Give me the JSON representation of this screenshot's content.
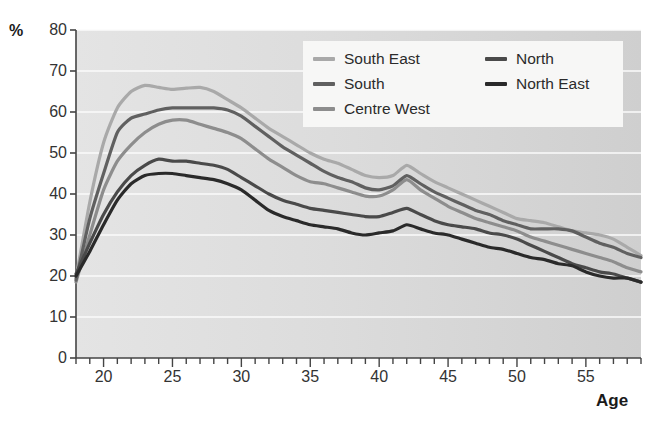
{
  "chart_data": {
    "type": "line",
    "title": "",
    "xlabel": "Age",
    "ylabel": "%",
    "xlim": [
      18,
      59
    ],
    "ylim": [
      0,
      80
    ],
    "grid": true,
    "legend_position": "top-right-inside",
    "y_ticks": [
      0,
      10,
      20,
      30,
      40,
      50,
      60,
      70,
      80
    ],
    "x_ticks": [
      20,
      25,
      30,
      35,
      40,
      45,
      50,
      55
    ],
    "x": [
      18,
      19,
      20,
      21,
      22,
      23,
      24,
      25,
      26,
      27,
      28,
      29,
      30,
      31,
      32,
      33,
      34,
      35,
      36,
      37,
      38,
      39,
      40,
      41,
      42,
      43,
      44,
      45,
      46,
      47,
      48,
      49,
      50,
      51,
      52,
      53,
      54,
      55,
      56,
      57,
      58,
      59
    ],
    "series": [
      {
        "name": "South East",
        "color": "#a9a9a9",
        "values": [
          19.5,
          38.0,
          52.5,
          61.0,
          65.0,
          66.5,
          66.0,
          65.5,
          65.8,
          66.0,
          65.0,
          63.0,
          61.0,
          58.5,
          56.0,
          54.0,
          52.0,
          50.0,
          48.5,
          47.5,
          46.0,
          44.5,
          44.0,
          44.5,
          47.0,
          45.0,
          43.0,
          41.5,
          40.0,
          38.5,
          37.0,
          35.5,
          34.0,
          33.5,
          33.0,
          32.0,
          31.0,
          30.5,
          30.0,
          29.0,
          27.0,
          25.0
        ]
      },
      {
        "name": "South",
        "color": "#606060",
        "values": [
          19.0,
          34.0,
          45.0,
          55.0,
          58.5,
          59.5,
          60.5,
          61.0,
          61.0,
          61.0,
          61.0,
          60.5,
          59.0,
          56.5,
          54.0,
          51.5,
          49.5,
          47.5,
          45.5,
          44.0,
          43.0,
          41.5,
          41.0,
          42.0,
          44.5,
          42.5,
          40.5,
          39.0,
          37.5,
          36.0,
          35.0,
          33.5,
          32.5,
          31.5,
          31.5,
          31.5,
          31.0,
          29.5,
          28.0,
          27.0,
          25.5,
          24.5
        ]
      },
      {
        "name": "Centre West",
        "color": "#8d8d8d",
        "values": [
          18.5,
          30.0,
          41.0,
          48.0,
          52.0,
          55.0,
          57.0,
          58.0,
          58.0,
          57.0,
          56.0,
          55.0,
          53.5,
          51.0,
          48.5,
          46.5,
          44.5,
          43.0,
          42.5,
          41.5,
          40.5,
          39.5,
          39.5,
          41.0,
          43.5,
          41.0,
          39.0,
          37.0,
          35.5,
          34.0,
          33.0,
          32.0,
          31.0,
          29.5,
          28.5,
          27.5,
          26.5,
          25.5,
          24.5,
          23.5,
          22.0,
          21.0
        ]
      },
      {
        "name": "North",
        "color": "#4a4a4a",
        "values": [
          20.5,
          28.0,
          35.0,
          40.5,
          44.5,
          47.0,
          48.5,
          48.0,
          48.0,
          47.5,
          47.0,
          46.0,
          44.0,
          42.0,
          40.0,
          38.5,
          37.5,
          36.5,
          36.0,
          35.5,
          35.0,
          34.5,
          34.5,
          35.5,
          36.5,
          35.0,
          33.5,
          32.5,
          32.0,
          31.5,
          30.5,
          30.0,
          29.0,
          27.5,
          26.0,
          24.5,
          23.0,
          22.0,
          21.0,
          20.5,
          19.5,
          18.5
        ]
      },
      {
        "name": "North East",
        "color": "#2a2a2a",
        "values": [
          20.0,
          26.0,
          32.5,
          38.5,
          42.5,
          44.5,
          45.0,
          45.0,
          44.5,
          44.0,
          43.5,
          42.5,
          41.0,
          38.5,
          36.0,
          34.5,
          33.5,
          32.5,
          32.0,
          31.5,
          30.5,
          30.0,
          30.5,
          31.0,
          32.5,
          31.5,
          30.5,
          30.0,
          29.0,
          28.0,
          27.0,
          26.5,
          25.5,
          24.5,
          24.0,
          23.0,
          22.5,
          21.0,
          20.0,
          19.5,
          19.5,
          18.5
        ]
      }
    ]
  },
  "axes": {
    "y_unit": "%",
    "x_title": "Age"
  },
  "legend": {
    "entries": [
      {
        "label": "South East",
        "color": "#a9a9a9",
        "column": 0,
        "row": 0
      },
      {
        "label": "South",
        "color": "#606060",
        "column": 0,
        "row": 1
      },
      {
        "label": "Centre West",
        "color": "#8d8d8d",
        "column": 0,
        "row": 2
      },
      {
        "label": "North",
        "color": "#4a4a4a",
        "column": 1,
        "row": 0
      },
      {
        "label": "North East",
        "color": "#2a2a2a",
        "column": 1,
        "row": 1
      }
    ]
  }
}
